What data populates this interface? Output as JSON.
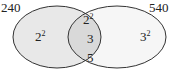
{
  "diagram": {
    "type": "venn",
    "left_set": {
      "label": "240",
      "factors": [
        {
          "base": "2",
          "exp": "2"
        }
      ],
      "fill": "#e8e8e8"
    },
    "right_set": {
      "label": "540",
      "factors": [
        {
          "base": "3",
          "exp": "2"
        }
      ],
      "fill": "#f6f6f6"
    },
    "intersection": {
      "factors": [
        {
          "base": "2",
          "exp": "2"
        },
        {
          "base": "3",
          "exp": ""
        },
        {
          "base": "5",
          "exp": ""
        }
      ],
      "fill": "#d9d9d9"
    },
    "stroke": "#333333"
  }
}
